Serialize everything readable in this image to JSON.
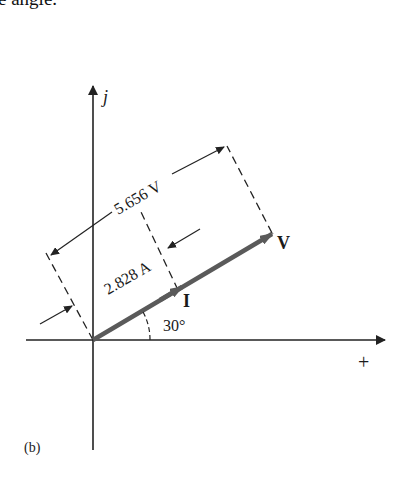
{
  "header_text": "e angle.",
  "figure_label": "(b)",
  "axes": {
    "vertical_label": "j",
    "horizontal_label": "+"
  },
  "phasors": [
    {
      "name": "I",
      "magnitude_label": "2.828 A",
      "angle_deg": 30,
      "color": "#5a5a5a"
    },
    {
      "name": "V",
      "magnitude_label": "5.656 V",
      "angle_deg": 30,
      "color": "#5a5a5a"
    }
  ],
  "angle_label": "30°",
  "colors": {
    "axis": "#222222",
    "phasor": "#5a5a5a",
    "dimension": "#222222"
  }
}
